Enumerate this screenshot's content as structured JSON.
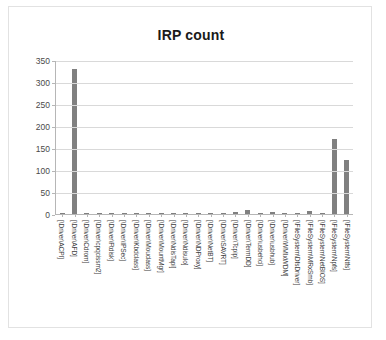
{
  "chart_data": {
    "type": "bar",
    "title": "IRP count",
    "xlabel": "",
    "ylabel": "",
    "ylim": [
      0,
      350
    ],
    "yticks": [
      0,
      50,
      100,
      150,
      200,
      250,
      300,
      350
    ],
    "grid": true,
    "legend": false,
    "bar_color": "#808080",
    "categories": [
      "[\\Driver\\ACPI]",
      "[\\Driver\\AFD]",
      "[\\Driver\\Cdrom]",
      "[\\Driver\\cpqcissm2]",
      "[\\Driver\\Ftdisk]",
      "[\\Driver\\IPSec]",
      "[\\Driver\\Kbdclass]",
      "[\\Driver\\Mouclass]",
      "[\\Driver\\MountMgr]",
      "[\\Driver\\NdisTapi]",
      "[\\Driver\\NdisuIo]",
      "[\\Driver\\NDProxy]",
      "[\\Driver\\NetBT]",
      "[\\Driver\\SAVRT]",
      "[\\Driver\\Tcpip]",
      "[\\Driver\\TermDD]",
      "[\\Driver\\usbehci]",
      "[\\Driver\\usbhub]",
      "[\\Driver\\WMIxWDM]",
      "[\\FileSystem\\DfsDriver]",
      "[\\FileSystem\\MRxSmb]",
      "[\\FileSystem\\NetBIOS]",
      "[\\FileSystem\\Npfs]",
      "[\\FileSystem\\Ntfs]"
    ],
    "values": [
      2,
      330,
      1,
      2,
      2,
      1,
      2,
      2,
      2,
      2,
      2,
      1,
      2,
      1,
      4,
      10,
      2,
      4,
      1,
      3,
      6,
      3,
      170,
      122
    ]
  }
}
